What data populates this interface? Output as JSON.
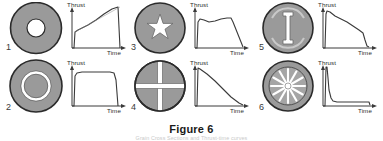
{
  "figure": {
    "caption": "Figure 6",
    "subcaption": "Grain Cross Sections and Thrust-time curves",
    "axis": {
      "y_label": "Thrust",
      "x_label": "Time"
    },
    "colors": {
      "propellant_fill": "#9a9a9a",
      "propellant_edge": "#2b2b2b",
      "port_fill": "#ffffff",
      "line": "#3a3a3a",
      "caption": "#1a1a1a",
      "page_background": "#ffffff"
    }
  },
  "items": [
    {
      "index": "1",
      "grain": {
        "name": "circular-port-grain",
        "port_shape": "circle",
        "outer_radius": 26,
        "port_radius": 9
      },
      "curve": {
        "name": "progressive-thrust-curve",
        "profile": "progressive",
        "points": "0,46 2,46 3,30 6,28 10,26 16,23 24,18 32,12 40,7 46,5 48,46",
        "guide": "3,30 48,5"
      }
    },
    {
      "index": "2",
      "grain": {
        "name": "annular-ring-grain",
        "port_shape": "thin-annulus",
        "outer_radius": 27,
        "ring_outer_radius": 14,
        "ring_inner_radius": 11
      },
      "curve": {
        "name": "neutral-thrust-curve",
        "profile": "neutral",
        "points": "0,46 2,46 3,16 5,13 10,12 20,12 30,12 38,12 42,13 44,20 46,46",
        "guide": ""
      }
    },
    {
      "index": "3",
      "grain": {
        "name": "star-port-grain",
        "port_shape": "five-point-star",
        "outer_radius": 26,
        "star_points": 5,
        "star_outer_radius": 13,
        "star_inner_radius": 4.5
      },
      "curve": {
        "name": "near-neutral-thrust-curve",
        "profile": "neutral",
        "points": "0,46 2,46 3,20 5,17 9,18 14,20 20,19 26,17 32,16 36,16 38,20 42,30 46,40 48,45",
        "guide": ""
      }
    },
    {
      "index": "4",
      "grain": {
        "name": "cruciform-port-grain",
        "port_shape": "cross",
        "outer_radius": 26,
        "slot_half_length": 26,
        "slot_width": 5
      },
      "curve": {
        "name": "regressive-thrust-curve",
        "profile": "regressive",
        "points": "0,46 2,46 3,8 5,9 12,14 20,21 28,29 36,37 44,43 48,45",
        "guide": ""
      }
    },
    {
      "index": "5",
      "grain": {
        "name": "dog-bone-slot-grain",
        "port_shape": "dog-bone",
        "outer_radius": 26,
        "slot_width": 4,
        "slot_height": 30
      },
      "curve": {
        "name": "stepped-regressive-thrust-curve",
        "profile": "regressive",
        "points": "0,46 2,46 3,12 4,9 7,10 12,14 18,17 24,20 30,24 36,28 40,31 42,38 44,44 46,45"
      }
    },
    {
      "index": "6",
      "grain": {
        "name": "multi-fin-wagon-wheel-grain",
        "port_shape": "wagon-wheel",
        "outer_radius": 26,
        "fin_count": 12,
        "hub_radius": 3
      },
      "curve": {
        "name": "boost-sustain-thrust-curve",
        "profile": "boost-sustain",
        "points": "0,46 2,46 3,7 4,7 5,18 6,30 8,38 10,41 14,42 22,42 32,42 42,42 46,42 47,45"
      }
    }
  ]
}
